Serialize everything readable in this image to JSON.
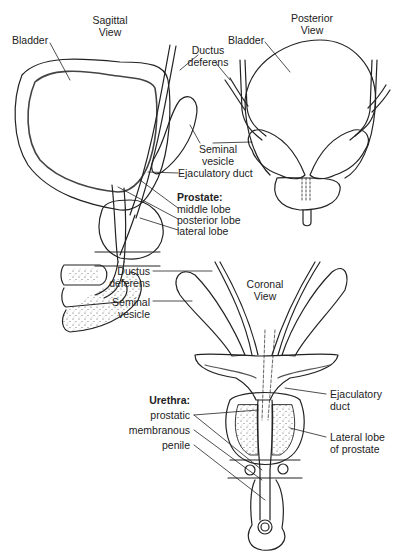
{
  "figure": {
    "sagittal_view": {
      "title_line1": "Sagittal",
      "title_line2": "View",
      "labels": {
        "bladder": "Bladder",
        "ductus_line1": "Ductus",
        "ductus_line2": "deferens",
        "seminal_line1": "Seminal",
        "seminal_line2": "vesicle",
        "ejaculatory_duct": "Ejaculatory duct",
        "prostate_heading": "Prostate:",
        "middle_lobe": "middle lobe",
        "posterior_lobe": "posterior lobe",
        "lateral_lobe": "lateral lobe"
      }
    },
    "posterior_view": {
      "title_line1": "Posterior",
      "title_line2": "View",
      "labels": {
        "bladder": "Bladder"
      }
    },
    "coronal_view": {
      "title_line1": "Coronal",
      "title_line2": "View",
      "labels": {
        "ductus_line1": "Ductus",
        "ductus_line2": "deferens",
        "seminal_line1": "Seminal",
        "seminal_line2": "vesicle",
        "urethra_heading": "Urethra:",
        "prostatic": "prostatic",
        "membranous": "membranous",
        "penile": "penile",
        "ejaculatory_line1": "Ejaculatory",
        "ejaculatory_line2": "duct",
        "lateral_lobe_line1": "Lateral lobe",
        "lateral_lobe_line2": "of prostate"
      }
    }
  }
}
